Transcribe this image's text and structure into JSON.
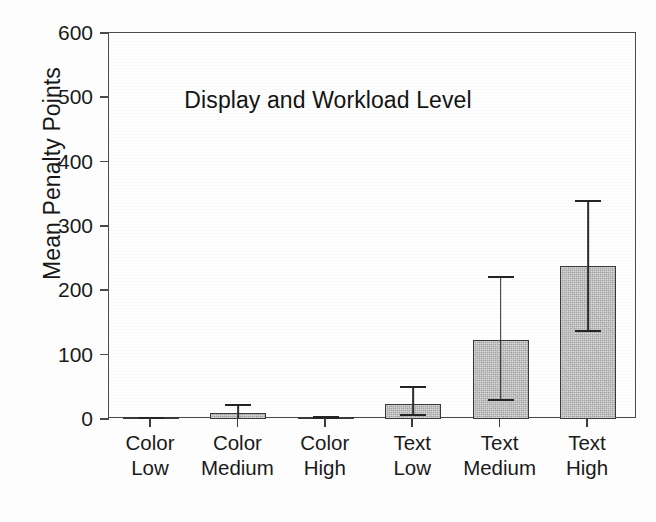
{
  "chart_data": {
    "type": "bar",
    "title": "",
    "xlabel": "Display and Workload Level",
    "ylabel": "Mean Penalty Points",
    "categories": [
      {
        "line1": "Color",
        "line2": "Low"
      },
      {
        "line1": "Color",
        "line2": "Medium"
      },
      {
        "line1": "Color",
        "line2": "High"
      },
      {
        "line1": "Text",
        "line2": "Low"
      },
      {
        "line1": "Text",
        "line2": "Medium"
      },
      {
        "line1": "Text",
        "line2": "High"
      }
    ],
    "category_labels": [
      "Color Low",
      "Color Medium",
      "Color High",
      "Text Low",
      "Text Medium",
      "Text High"
    ],
    "values": [
      1,
      9,
      2,
      24,
      123,
      238
    ],
    "error_upper": [
      3,
      23,
      4,
      51,
      222,
      340
    ],
    "error_lower": [
      0,
      0,
      0,
      8,
      31,
      138
    ],
    "ylim": [
      0,
      600
    ],
    "yticks": [
      0,
      100,
      200,
      300,
      400,
      500,
      600
    ],
    "ytick_labels": [
      "0",
      "100",
      "200",
      "300",
      "400",
      "500",
      "600"
    ],
    "grid": false,
    "legend": null,
    "bar_color": "#a9a9a9",
    "bar_edge_color": "#3a3a3a",
    "error_color": "#242424",
    "axis_color": "#4a4a4a"
  }
}
